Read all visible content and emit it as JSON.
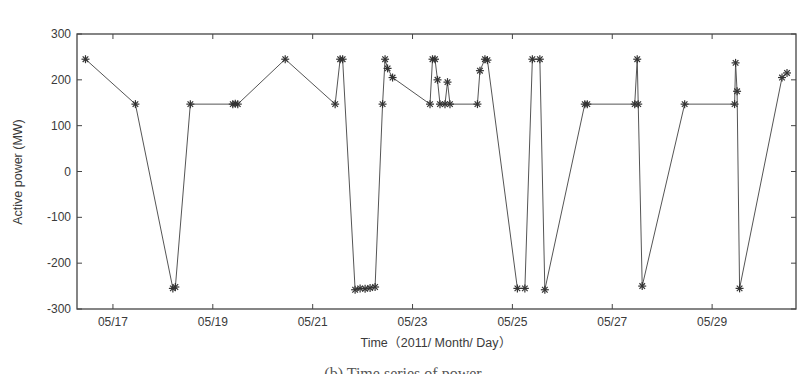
{
  "chart_data": {
    "type": "line",
    "title": "",
    "xlabel": "Time（2011/ Month/ Day）",
    "ylabel": "Active power (MW)",
    "ylim": [
      -300,
      300
    ],
    "yticks": [
      300,
      200,
      100,
      0,
      -100,
      -200,
      -300
    ],
    "xlim_day": [
      16.28,
      30.68
    ],
    "xticks": [
      {
        "day": 17,
        "label": "05/17"
      },
      {
        "day": 19,
        "label": "05/19"
      },
      {
        "day": 21,
        "label": "05/21"
      },
      {
        "day": 23,
        "label": "05/23"
      },
      {
        "day": 25,
        "label": "05/25"
      },
      {
        "day": 27,
        "label": "05/27"
      },
      {
        "day": 29,
        "label": "05/29"
      }
    ],
    "grid": false,
    "legend": null,
    "marker": "asterisk",
    "line_color": "#555555",
    "series": [
      {
        "name": "Active power",
        "x_day": [
          16.45,
          17.45,
          18.2,
          18.25,
          18.55,
          19.4,
          19.45,
          19.5,
          20.45,
          21.45,
          21.55,
          21.6,
          21.85,
          21.95,
          22.05,
          22.15,
          22.25,
          22.4,
          22.45,
          22.5,
          22.6,
          23.35,
          23.4,
          23.45,
          23.5,
          23.55,
          23.65,
          23.7,
          23.75,
          24.3,
          24.35,
          24.45,
          24.5,
          25.1,
          25.25,
          25.4,
          25.55,
          25.65,
          26.45,
          26.5,
          27.45,
          27.5,
          27.52,
          27.6,
          28.45,
          29.45,
          29.47,
          29.5,
          29.55,
          30.4,
          30.5
        ],
        "values": [
          245,
          147,
          -255,
          -252,
          147,
          147,
          148,
          147,
          245,
          147,
          245,
          245,
          -258,
          -255,
          -256,
          -254,
          -252,
          147,
          245,
          225,
          205,
          147,
          245,
          245,
          200,
          147,
          147,
          195,
          147,
          147,
          220,
          245,
          243,
          -255,
          -255,
          245,
          245,
          -258,
          147,
          147,
          147,
          245,
          147,
          -250,
          147,
          147,
          237,
          175,
          -255,
          205,
          215
        ]
      }
    ]
  },
  "caption": "(b) Time series of power"
}
